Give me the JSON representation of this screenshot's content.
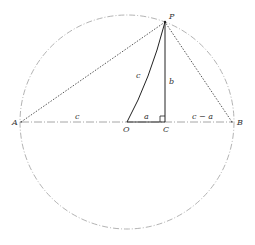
{
  "diagram": {
    "points": {
      "A": {
        "label": "A",
        "x": 21,
        "y": 122
      },
      "O": {
        "label": "O",
        "x": 127,
        "y": 122
      },
      "C": {
        "label": "C",
        "x": 165,
        "y": 122
      },
      "B": {
        "label": "B",
        "x": 232,
        "y": 122
      },
      "P": {
        "label": "P",
        "x": 165,
        "y": 22
      }
    },
    "segment_labels": {
      "AO": "c",
      "OC": "a",
      "CB": "c − a",
      "OP": "c",
      "PC": "b"
    },
    "circle": {
      "cx": 127,
      "cy": 122,
      "r": 107
    },
    "colors": {
      "solid": "#222222",
      "dotted": "#444444",
      "circle": "#9a9a9a",
      "diameter": "#8a8a8a"
    }
  }
}
